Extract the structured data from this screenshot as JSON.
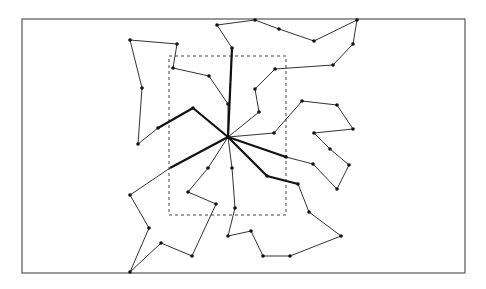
{
  "diagram": {
    "type": "star-tree-loops",
    "colors": {
      "background": "#ffffff",
      "border": "#555555",
      "dashed_box": "#444444",
      "edge": "#333333",
      "thick_edge": "#111111",
      "node": "#111111"
    },
    "outer_border": {
      "x": 22,
      "y": 19,
      "w": 443,
      "h": 254
    },
    "dashed_box": {
      "x": 169,
      "y": 56,
      "w": 117,
      "h": 159
    },
    "hub": {
      "x": 228,
      "y": 137
    },
    "loops": [
      {
        "name": "top",
        "thick_end": [
          232,
          48
        ],
        "points": [
          [
            228,
            137
          ],
          [
            232,
            48
          ],
          [
            217,
            25
          ],
          [
            255,
            20
          ],
          [
            279,
            29
          ],
          [
            314,
            41
          ],
          [
            357,
            20
          ],
          [
            353,
            44
          ],
          [
            333,
            65
          ],
          [
            275,
            69
          ],
          [
            255,
            89
          ],
          [
            259,
            112
          ],
          [
            228,
            137
          ]
        ],
        "nodes": [
          [
            232,
            48
          ],
          [
            217,
            25
          ],
          [
            255,
            20
          ],
          [
            279,
            29
          ],
          [
            314,
            41
          ],
          [
            357,
            20
          ],
          [
            353,
            44
          ],
          [
            333,
            65
          ],
          [
            275,
            69
          ],
          [
            255,
            89
          ],
          [
            259,
            112
          ]
        ]
      },
      {
        "name": "left",
        "thick_path": [
          [
            228,
            137
          ],
          [
            193,
            108
          ],
          [
            158,
            128
          ]
        ],
        "points": [
          [
            158,
            128
          ],
          [
            138,
            144
          ],
          [
            142,
            88
          ],
          [
            130,
            40
          ],
          [
            177,
            44
          ],
          [
            173,
            68
          ],
          [
            209,
            76
          ],
          [
            228,
            104
          ],
          [
            228,
            137
          ]
        ],
        "nodes": [
          [
            193,
            108
          ],
          [
            158,
            128
          ],
          [
            138,
            144
          ],
          [
            142,
            88
          ],
          [
            130,
            40
          ],
          [
            177,
            44
          ],
          [
            173,
            68
          ],
          [
            209,
            76
          ],
          [
            228,
            104
          ]
        ]
      },
      {
        "name": "right",
        "thick_path": [
          [
            228,
            137
          ],
          [
            286,
            157
          ]
        ],
        "points": [
          [
            228,
            137
          ],
          [
            274,
            133
          ],
          [
            302,
            101
          ],
          [
            337,
            105
          ],
          [
            353,
            129
          ],
          [
            314,
            133
          ],
          [
            330,
            149
          ],
          [
            349,
            165
          ],
          [
            337,
            189
          ],
          [
            313,
            164
          ],
          [
            286,
            157
          ]
        ],
        "nodes": [
          [
            274,
            133
          ],
          [
            302,
            101
          ],
          [
            337,
            105
          ],
          [
            353,
            129
          ],
          [
            314,
            133
          ],
          [
            330,
            149
          ],
          [
            349,
            165
          ],
          [
            337,
            189
          ],
          [
            313,
            164
          ],
          [
            286,
            157
          ]
        ]
      },
      {
        "name": "lower-right",
        "thick_path": [
          [
            228,
            137
          ],
          [
            267,
            176
          ],
          [
            298,
            184
          ]
        ],
        "points": [
          [
            298,
            184
          ],
          [
            309,
            212
          ],
          [
            341,
            236
          ],
          [
            290,
            256
          ],
          [
            263,
            256
          ],
          [
            251,
            231
          ],
          [
            228,
            236
          ],
          [
            235,
            208
          ],
          [
            232,
            168
          ],
          [
            228,
            137
          ]
        ],
        "nodes": [
          [
            267,
            176
          ],
          [
            298,
            184
          ],
          [
            309,
            212
          ],
          [
            341,
            236
          ],
          [
            290,
            256
          ],
          [
            263,
            256
          ],
          [
            251,
            231
          ],
          [
            228,
            236
          ],
          [
            235,
            208
          ],
          [
            232,
            168
          ]
        ]
      },
      {
        "name": "lower-left",
        "thick_path": [
          [
            228,
            137
          ],
          [
            170,
            168
          ]
        ],
        "points": [
          [
            170,
            168
          ],
          [
            130,
            195
          ],
          [
            149,
            228
          ],
          [
            130,
            272
          ],
          [
            161,
            243
          ],
          [
            192,
            256
          ],
          [
            216,
            204
          ],
          [
            188,
            192
          ],
          [
            208,
            168
          ],
          [
            228,
            137
          ]
        ],
        "nodes": [
          [
            130,
            195
          ],
          [
            149,
            228
          ],
          [
            130,
            272
          ],
          [
            161,
            243
          ],
          [
            192,
            256
          ],
          [
            216,
            204
          ],
          [
            188,
            192
          ],
          [
            208,
            168
          ]
        ]
      }
    ]
  }
}
